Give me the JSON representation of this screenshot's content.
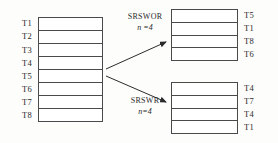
{
  "diagram": {
    "population": {
      "name": "population-frame",
      "units": [
        "T1",
        "T2",
        "T3",
        "T4",
        "T5",
        "T6",
        "T7",
        "T8"
      ]
    },
    "methods": [
      {
        "id": "srswor",
        "name": "SRSWOR",
        "sample_size_label": "n =4",
        "sample_units": [
          "T5",
          "T1",
          "T8",
          "T6"
        ]
      },
      {
        "id": "srswr",
        "name": "SRSWR",
        "sample_size_label": "n=4",
        "sample_units": [
          "T4",
          "T7",
          "T4",
          "T1"
        ]
      }
    ],
    "colors": {
      "line": "#4a4a4a",
      "text": "#2b2b2b",
      "background": "#fdfdfc",
      "cell": "#ffffff"
    }
  }
}
